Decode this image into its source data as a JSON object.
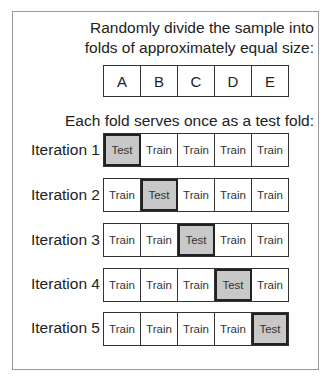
{
  "header": {
    "line1": "Randomly divide the sample into",
    "line2": "folds of approximately equal size:"
  },
  "folds": [
    "A",
    "B",
    "C",
    "D",
    "E"
  ],
  "subheader": "Each fold serves once as a test fold:",
  "iterations": [
    {
      "label": "Iteration 1",
      "cells": [
        "Test",
        "Train",
        "Train",
        "Train",
        "Train"
      ],
      "test_index": 0
    },
    {
      "label": "Iteration 2",
      "cells": [
        "Train",
        "Test",
        "Train",
        "Train",
        "Train"
      ],
      "test_index": 1
    },
    {
      "label": "Iteration 3",
      "cells": [
        "Train",
        "Train",
        "Test",
        "Train",
        "Train"
      ],
      "test_index": 2
    },
    {
      "label": "Iteration 4",
      "cells": [
        "Train",
        "Train",
        "Train",
        "Test",
        "Train"
      ],
      "test_index": 3
    },
    {
      "label": "Iteration 5",
      "cells": [
        "Train",
        "Train",
        "Train",
        "Train",
        "Test"
      ],
      "test_index": 4
    }
  ],
  "colors": {
    "test_fill": "#c8c8c8",
    "train_fill": "#ffffff",
    "border": "#333333",
    "frame": "#9a9a9a"
  }
}
